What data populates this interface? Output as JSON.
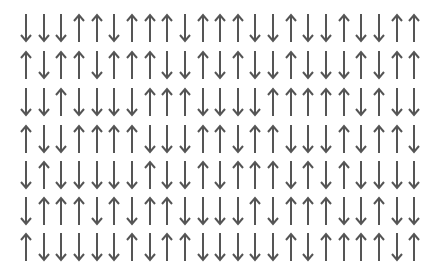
{
  "grid": {
    "columns": 23,
    "rows": 7,
    "arrow_color": "#555555",
    "legend": {
      "U": "up-arrow",
      "D": "down-arrow"
    },
    "layout": {
      "x_start": 26,
      "x_step": 17.65,
      "y_centers": [
        28,
        65,
        102,
        139,
        175,
        211,
        247
      ]
    },
    "data": [
      "DDDUUDUUUDUUUDDUDDUDDUU",
      "UDUUDUUUDDUDUDDUDDDUDUU",
      "DDUDDDDUUUDDDDUUUUUDUDD",
      "UDDUUUUDDDUUDUUDDDUDUUD",
      "DUDDDDDUDDUDUUUDUDUDDDD",
      "DUUUDUDUUDDDDUDUUUDDUDD",
      "UDDDDDUDUUDDDDDUDUUUUDU"
    ]
  }
}
